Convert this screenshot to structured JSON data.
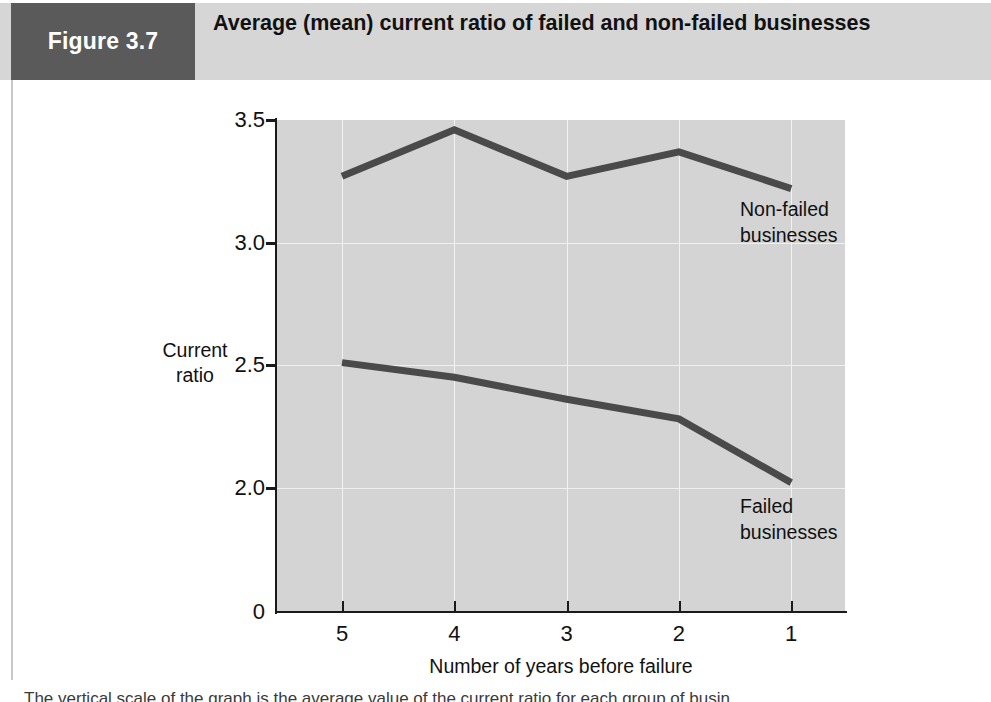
{
  "figure": {
    "tag": "Figure 3.7",
    "title": "Average (mean) current ratio of failed and non-failed businesses",
    "tag_bg": "#5a5a5a",
    "band_bg": "#d6d6d6"
  },
  "caption": "The vertical scale of the graph is the average value of the current ratio for each group of busin",
  "chart_data": {
    "type": "line",
    "title": "Average (mean) current ratio of failed and non-failed businesses",
    "xlabel": "Number of years before failure",
    "ylabel": "Current ratio",
    "ylabel_lines": [
      "Current",
      "ratio"
    ],
    "categories": [
      "5",
      "4",
      "3",
      "2",
      "1"
    ],
    "x_tick_labels": [
      "5",
      "4",
      "3",
      "2",
      "1"
    ],
    "y_tick_labels": [
      "3.5",
      "3.0",
      "2.5",
      "2.0",
      "0"
    ],
    "y_tick_values": [
      3.5,
      3.0,
      2.5,
      2.0,
      0
    ],
    "ylim": [
      0,
      3.5
    ],
    "grid": true,
    "legend": "inline-annotations",
    "plot_bg": "#d4d4d4",
    "line_color": "#4a4a4a",
    "series": [
      {
        "name": "Non-failed businesses",
        "label_lines": [
          "Non-failed",
          "businesses"
        ],
        "values": [
          3.27,
          3.46,
          3.27,
          3.37,
          3.22
        ]
      },
      {
        "name": "Failed businesses",
        "label_lines": [
          "Failed",
          "businesses"
        ],
        "values": [
          2.51,
          2.45,
          2.36,
          2.28,
          2.02
        ]
      }
    ]
  }
}
